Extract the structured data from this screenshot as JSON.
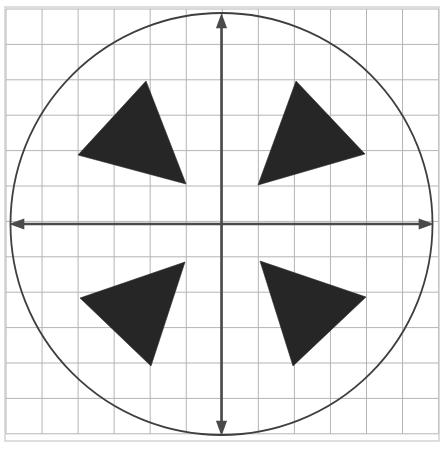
{
  "figure": {
    "width": 443,
    "height": 449,
    "background_color": "#ffffff"
  },
  "frame": {
    "name": "outer-border",
    "x": 5,
    "y": 7,
    "width": 434,
    "height": 434,
    "stroke_color": "#c9c9c9",
    "stroke_width": 1.2
  },
  "grid": {
    "name": "square-grid",
    "origin_x": 6,
    "origin_y": 9,
    "cell_width": 36.05,
    "cell_height": 35.4,
    "columns": 12,
    "rows": 12,
    "line_color": "#b4b4b4",
    "line_width": 1
  },
  "axes": {
    "center_x": 221.5,
    "center_y": 224,
    "line_color": "#4a4a4a",
    "line_width": 2.6,
    "arrow_size": 9,
    "horizontal": {
      "label": "x-axis",
      "x_start": 9,
      "x_end": 434,
      "y": 224,
      "arrowheads": "both"
    },
    "vertical": {
      "label": "y-axis",
      "x": 221.5,
      "y_start": 13,
      "y_end": 436,
      "arrowheads": "both"
    }
  },
  "circle": {
    "name": "bounding-circle",
    "center_x": 221.5,
    "center_y": 224,
    "radius": 211,
    "stroke_color": "#3f3f3f",
    "stroke_width": 1.8,
    "fill": "none"
  },
  "triangles": [
    {
      "name": "triangle-quadrant-2",
      "quadrant": "upper-left",
      "fill_color": "#262626",
      "points": [
        [
          146,
          81
        ],
        [
          78,
          155
        ],
        [
          186,
          184
        ]
      ]
    },
    {
      "name": "triangle-quadrant-1",
      "quadrant": "upper-right",
      "fill_color": "#262626",
      "points": [
        [
          296,
          81
        ],
        [
          365,
          154
        ],
        [
          258,
          185
        ]
      ]
    },
    {
      "name": "triangle-quadrant-3",
      "quadrant": "lower-left",
      "fill_color": "#262626",
      "points": [
        [
          185,
          262
        ],
        [
          80,
          298
        ],
        [
          151,
          366
        ]
      ]
    },
    {
      "name": "triangle-quadrant-4",
      "quadrant": "lower-right",
      "fill_color": "#262626",
      "points": [
        [
          260,
          261
        ],
        [
          366,
          297
        ],
        [
          293,
          366
        ]
      ]
    }
  ]
}
